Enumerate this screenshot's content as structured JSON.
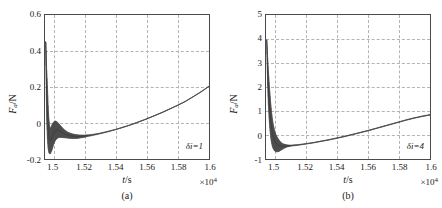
{
  "figure": {
    "panels": [
      {
        "key": "a",
        "caption": "(a)",
        "annotation": "δi=1",
        "annotation_symbol": "δ",
        "annotation_rest": "i=1",
        "ylabel_main": "F",
        "ylabel_sub": "a",
        "ylabel_unit": "/N",
        "xlabel_main": "t",
        "xlabel_unit": "/s",
        "x_multiplier": "×10",
        "x_multiplier_exp": "4",
        "yticks": [
          "0.6",
          "0.4",
          "0.2",
          "0",
          "-0.2"
        ],
        "xticks": [
          "1.5",
          "1.52",
          "1.54",
          "1.56",
          "1.58",
          "1.6"
        ]
      },
      {
        "key": "b",
        "caption": "(b)",
        "annotation": "δi=4",
        "annotation_symbol": "δ",
        "annotation_rest": "i=4",
        "ylabel_main": "F",
        "ylabel_sub": "a",
        "ylabel_unit": "/N",
        "xlabel_main": "t",
        "xlabel_unit": "/s",
        "x_multiplier": "×10",
        "x_multiplier_exp": "4",
        "yticks": [
          "5",
          "4",
          "3",
          "2",
          "1",
          "0",
          "-1"
        ],
        "xticks": [
          "1.5",
          "1.52",
          "1.54",
          "1.56",
          "1.58",
          "1.6"
        ]
      }
    ]
  },
  "chart_data": [
    {
      "type": "line",
      "panel": "a",
      "title": "",
      "subtitle": "(a)",
      "xlabel": "t/s",
      "ylabel": "F_a/N",
      "x_multiplier": 10000,
      "xlim": [
        1.4945,
        1.6
      ],
      "ylim": [
        -0.2,
        0.6
      ],
      "xticks": [
        1.5,
        1.52,
        1.54,
        1.56,
        1.58,
        1.6
      ],
      "yticks": [
        -0.2,
        0,
        0.2,
        0.4,
        0.6
      ],
      "grid": true,
      "legend": null,
      "annotations": [
        {
          "text": "δi=1",
          "x": 1.585,
          "y": -0.125
        }
      ],
      "series": [
        {
          "name": "F_a envelope upper",
          "color": "#555555",
          "x": [
            1.495,
            1.4955,
            1.496,
            1.4965,
            1.497,
            1.4975,
            1.498,
            1.499,
            1.5,
            1.501,
            1.502,
            1.503,
            1.504,
            1.505,
            1.506,
            1.507,
            1.508,
            1.509,
            1.51,
            1.512,
            1.514,
            1.516,
            1.518,
            1.52,
            1.525,
            1.53,
            1.535,
            1.54,
            1.545,
            1.55,
            1.555,
            1.56,
            1.565,
            1.57,
            1.575,
            1.58,
            1.585,
            1.59,
            1.595,
            1.6
          ],
          "y": [
            0.45,
            0.31,
            0.22,
            0.1,
            0.02,
            -0.02,
            -0.03,
            -0.01,
            0.005,
            0.012,
            0.008,
            0.0,
            -0.01,
            -0.02,
            -0.03,
            -0.038,
            -0.044,
            -0.05,
            -0.054,
            -0.06,
            -0.064,
            -0.066,
            -0.067,
            -0.067,
            -0.063,
            -0.056,
            -0.046,
            -0.035,
            -0.022,
            -0.008,
            0.008,
            0.024,
            0.042,
            0.06,
            0.08,
            0.1,
            0.122,
            0.148,
            0.175,
            0.205
          ]
        },
        {
          "name": "F_a envelope lower",
          "color": "#555555",
          "x": [
            1.495,
            1.4955,
            1.496,
            1.4965,
            1.497,
            1.4975,
            1.498,
            1.499,
            1.5,
            1.501,
            1.502,
            1.503,
            1.504,
            1.505,
            1.506,
            1.507,
            1.508,
            1.509,
            1.51,
            1.512,
            1.514,
            1.516,
            1.518,
            1.52,
            1.525,
            1.53,
            1.535,
            1.54,
            1.545,
            1.55,
            1.555,
            1.56,
            1.565,
            1.57,
            1.575,
            1.58,
            1.585,
            1.59,
            1.595,
            1.6
          ],
          "y": [
            0.45,
            0.05,
            -0.08,
            -0.14,
            -0.165,
            -0.172,
            -0.17,
            -0.15,
            -0.12,
            -0.1,
            -0.088,
            -0.082,
            -0.08,
            -0.08,
            -0.081,
            -0.082,
            -0.083,
            -0.084,
            -0.085,
            -0.086,
            -0.086,
            -0.085,
            -0.082,
            -0.079,
            -0.07,
            -0.06,
            -0.049,
            -0.037,
            -0.024,
            -0.01,
            0.006,
            0.022,
            0.04,
            0.058,
            0.078,
            0.098,
            0.12,
            0.146,
            0.173,
            0.203
          ]
        }
      ],
      "description": "Sharp positive spike to ~0.45 N at t=1.495e4 s, rapid decay into a high-frequency damped oscillation band bounded between about -0.17 and +0.02 N, settling near -0.07 N by t=1.52e4 s, then a smooth near-linear rise to about 0.21 N at t=1.6e4 s."
    },
    {
      "type": "line",
      "panel": "b",
      "title": "",
      "subtitle": "(b)",
      "xlabel": "t/s",
      "ylabel": "F_a/N",
      "x_multiplier": 10000,
      "xlim": [
        1.4945,
        1.6
      ],
      "ylim": [
        -1,
        5
      ],
      "xticks": [
        1.5,
        1.52,
        1.54,
        1.56,
        1.58,
        1.6
      ],
      "yticks": [
        -1,
        0,
        1,
        2,
        3,
        4,
        5
      ],
      "grid": true,
      "legend": null,
      "annotations": [
        {
          "text": "δi=4",
          "x": 1.585,
          "y": -0.62
        }
      ],
      "series": [
        {
          "name": "F_a envelope upper",
          "color": "#555555",
          "x": [
            1.495,
            1.4955,
            1.496,
            1.4965,
            1.497,
            1.4975,
            1.498,
            1.4985,
            1.499,
            1.5,
            1.501,
            1.502,
            1.503,
            1.504,
            1.505,
            1.506,
            1.508,
            1.51,
            1.515,
            1.52,
            1.525,
            1.53,
            1.535,
            1.54,
            1.545,
            1.55,
            1.555,
            1.56,
            1.565,
            1.57,
            1.575,
            1.58,
            1.585,
            1.59,
            1.595,
            1.6
          ],
          "y": [
            3.95,
            3.3,
            2.7,
            2.2,
            1.75,
            1.35,
            1.0,
            0.72,
            0.5,
            0.18,
            0.0,
            -0.12,
            -0.22,
            -0.3,
            -0.35,
            -0.38,
            -0.41,
            -0.42,
            -0.4,
            -0.36,
            -0.31,
            -0.25,
            -0.19,
            -0.12,
            -0.05,
            0.03,
            0.11,
            0.19,
            0.28,
            0.37,
            0.46,
            0.55,
            0.64,
            0.72,
            0.79,
            0.85
          ]
        },
        {
          "name": "F_a envelope lower",
          "color": "#555555",
          "x": [
            1.495,
            1.4955,
            1.496,
            1.4965,
            1.497,
            1.4975,
            1.498,
            1.4985,
            1.499,
            1.5,
            1.501,
            1.502,
            1.503,
            1.504,
            1.505,
            1.506,
            1.508,
            1.51,
            1.515,
            1.52,
            1.525,
            1.53,
            1.535,
            1.54,
            1.545,
            1.55,
            1.555,
            1.56,
            1.565,
            1.57,
            1.575,
            1.58,
            1.585,
            1.59,
            1.595,
            1.6
          ],
          "y": [
            3.95,
            2.2,
            1.3,
            0.7,
            0.25,
            -0.08,
            -0.3,
            -0.45,
            -0.55,
            -0.66,
            -0.7,
            -0.7,
            -0.68,
            -0.64,
            -0.6,
            -0.56,
            -0.5,
            -0.47,
            -0.43,
            -0.38,
            -0.33,
            -0.27,
            -0.21,
            -0.14,
            -0.07,
            0.01,
            0.09,
            0.17,
            0.26,
            0.35,
            0.44,
            0.53,
            0.62,
            0.7,
            0.77,
            0.83
          ]
        }
      ],
      "description": "Sharp positive spike to ~4 N at t=1.495e4 s decaying steeply, a damped oscillation band dipping to about -0.7 N around t=1.501e4 s, then a smooth near-linear rise to about 0.85 N at t=1.6e4 s."
    }
  ]
}
